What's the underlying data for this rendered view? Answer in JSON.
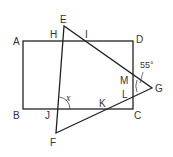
{
  "diagram": {
    "type": "geometry",
    "colors": {
      "stroke": "#222222",
      "text": "#333333",
      "background": "#ffffff"
    },
    "points": {
      "A": "A",
      "B": "B",
      "C": "C",
      "D": "D",
      "E": "E",
      "F": "F",
      "G": "G",
      "H": "H",
      "I": "I",
      "J": "J",
      "K": "K",
      "L": "L",
      "M": "M"
    },
    "angles": {
      "given": "55°",
      "unknown": "x"
    }
  }
}
